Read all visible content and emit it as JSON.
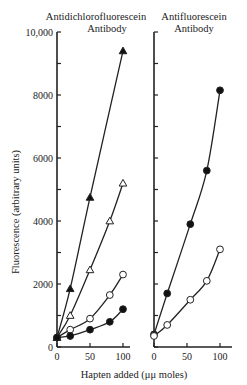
{
  "chart_data": {
    "type": "line",
    "ylabel": "Fluorescence (arbitrary units)",
    "xlabel": "Hapten added (μμ moles)",
    "ylim": [
      0,
      10000
    ],
    "yticks": [
      0,
      2000,
      4000,
      6000,
      8000,
      10000
    ],
    "ytick_labels": [
      "0",
      "2000",
      "4000",
      "6000",
      "8000",
      "10,000"
    ],
    "xticks": [
      0,
      50,
      100
    ],
    "xtick_labels": [
      "0",
      "50",
      "100"
    ],
    "grid": false,
    "panels": [
      {
        "title_line1": "Antidichlorofluorescein",
        "title_line2": "Antibody",
        "series": [
          {
            "name": "filled-triangle",
            "marker": "filled-triangle",
            "x": [
              0,
              20,
              50,
              100
            ],
            "y": [
              300,
              1850,
              4750,
              9400
            ]
          },
          {
            "name": "open-triangle",
            "marker": "open-triangle",
            "x": [
              0,
              20,
              50,
              80,
              100
            ],
            "y": [
              300,
              1000,
              2450,
              4000,
              5200
            ]
          },
          {
            "name": "open-circle",
            "marker": "open-circle",
            "x": [
              0,
              20,
              50,
              80,
              100
            ],
            "y": [
              300,
              550,
              900,
              1650,
              2300
            ]
          },
          {
            "name": "filled-circle",
            "marker": "filled-circle",
            "x": [
              0,
              20,
              50,
              80,
              100
            ],
            "y": [
              300,
              350,
              550,
              800,
              1200
            ]
          }
        ]
      },
      {
        "title_line1": "Antifluorescein",
        "title_line2": "Antibody",
        "series": [
          {
            "name": "filled-circle",
            "marker": "filled-circle",
            "x": [
              0,
              20,
              55,
              80,
              100
            ],
            "y": [
              400,
              1700,
              3900,
              5600,
              8150
            ]
          },
          {
            "name": "open-circle",
            "marker": "open-circle",
            "x": [
              0,
              20,
              55,
              80,
              100
            ],
            "y": [
              350,
              700,
              1500,
              2100,
              3100
            ]
          }
        ]
      }
    ]
  }
}
